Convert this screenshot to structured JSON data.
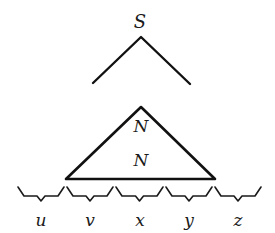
{
  "diagram": {
    "root_label": "S",
    "upper_node_label": "N",
    "lower_node_label": "N",
    "segments": [
      {
        "label": "u",
        "x1": 17,
        "x2": 65
      },
      {
        "label": "v",
        "x1": 66,
        "x2": 114
      },
      {
        "label": "x",
        "x1": 115,
        "x2": 164
      },
      {
        "label": "y",
        "x1": 165,
        "x2": 213
      },
      {
        "label": "z",
        "x1": 214,
        "x2": 262
      }
    ],
    "colors": {
      "stroke": "#111111",
      "background": "#ffffff"
    }
  }
}
